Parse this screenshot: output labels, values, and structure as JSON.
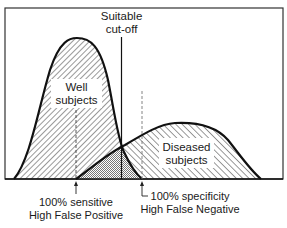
{
  "diagram": {
    "cutoff_label": [
      "Suitable",
      "cut-off"
    ],
    "well_label": [
      "Well",
      "subjects"
    ],
    "diseased_label": [
      "Diseased",
      "subjects"
    ],
    "left_annotation": [
      "100% sensitive",
      "High False Positive"
    ],
    "right_annotation": [
      "100% specificity",
      "High False Negative"
    ],
    "colors": {
      "stroke": "#111111",
      "frame": "#333333",
      "background": "#ffffff",
      "hatch": "#333333"
    }
  }
}
